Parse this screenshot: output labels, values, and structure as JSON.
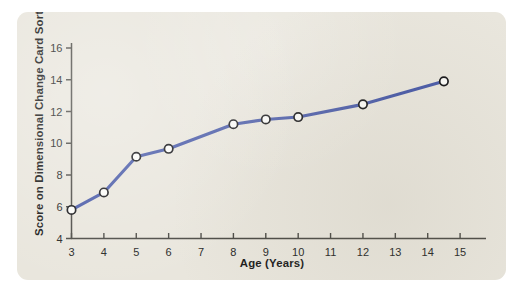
{
  "page": {
    "background_color": "#ffffff",
    "top_cut_text": ""
  },
  "figure": {
    "card_background_color": "#e9e6dd",
    "corner_radius_px": 11
  },
  "chart_data": {
    "type": "line",
    "title": "",
    "xlabel": "Age (Years)",
    "ylabel": "Score on Dimensional Change Card Sort",
    "xlim": [
      3,
      15.8
    ],
    "ylim": [
      4,
      16
    ],
    "xticks": [
      3,
      4,
      5,
      6,
      7,
      8,
      9,
      10,
      11,
      12,
      13,
      14,
      15
    ],
    "xtick_labels": [
      "3",
      "4",
      "5",
      "6",
      "7",
      "8",
      "9",
      "10",
      "11",
      "12",
      "13",
      "14",
      "15"
    ],
    "yticks": [
      4,
      6,
      8,
      10,
      12,
      14,
      16
    ],
    "ytick_labels": [
      "4",
      "6",
      "8",
      "10",
      "12",
      "14",
      "16"
    ],
    "grid": false,
    "legend": false,
    "legend_position": "none",
    "line_color": "#4a5ba8",
    "marker_fill_color": "#fbfbf8",
    "marker_edge_color": "#17171a",
    "axis_color": "#4b4a45",
    "x": [
      3,
      4,
      5,
      6,
      8,
      9,
      10,
      12,
      14.5
    ],
    "y": [
      5.8,
      6.9,
      9.15,
      9.65,
      11.2,
      11.5,
      11.65,
      12.45,
      13.9
    ],
    "series": [
      {
        "name": "Dimensional Change Card Sort score",
        "points": [
          {
            "x": 3,
            "y": 5.8
          },
          {
            "x": 4,
            "y": 6.9
          },
          {
            "x": 5,
            "y": 9.15
          },
          {
            "x": 6,
            "y": 9.65
          },
          {
            "x": 8,
            "y": 11.2
          },
          {
            "x": 9,
            "y": 11.5
          },
          {
            "x": 10,
            "y": 11.65
          },
          {
            "x": 12,
            "y": 12.45
          },
          {
            "x": 14.5,
            "y": 13.9
          }
        ]
      }
    ]
  }
}
